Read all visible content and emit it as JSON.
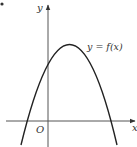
{
  "diagram": {
    "type": "function-graph",
    "axes": {
      "x_label": "x",
      "y_label": "y",
      "origin_label": "O"
    },
    "curve": {
      "label": "y = f(x)",
      "shape": "parabola-opening-down",
      "color": "#222222"
    },
    "colors": {
      "axis": "#555555",
      "text": "#333333",
      "background": "#ffffff"
    }
  }
}
